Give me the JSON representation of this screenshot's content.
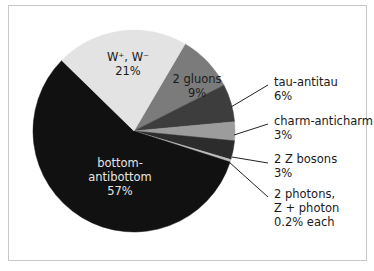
{
  "chart_data": {
    "type": "pie",
    "title": "",
    "center": [
      134,
      131
    ],
    "radius": 101,
    "start_angle_deg": -59.6,
    "slices": [
      {
        "name": "gluons",
        "label": "2 gluons",
        "value": 9,
        "value_label": "9%",
        "color": "#7b7b7b"
      },
      {
        "name": "tau",
        "label": "tau-antitau",
        "value": 6,
        "value_label": "6%",
        "color": "#3d3d3d"
      },
      {
        "name": "charm",
        "label": "charm-anticharm",
        "value": 3,
        "value_label": "3%",
        "color": "#9c9c9c"
      },
      {
        "name": "zz",
        "label": "2 Z bosons",
        "value": 3,
        "value_label": "3%",
        "color": "#2c2c2c"
      },
      {
        "name": "photons",
        "label": "2 photons, Z + photon",
        "value": 0.4,
        "value_label": "0.2% each",
        "color": "#bdbdbd"
      },
      {
        "name": "bottom",
        "label": "bottom-antibottom",
        "value": 57,
        "value_label": "57%",
        "color": "#111111"
      },
      {
        "name": "ww",
        "label": "W+, W-",
        "value": 21,
        "value_label": "21%",
        "color": "#e3e3e3"
      }
    ]
  },
  "labels": {
    "ww": {
      "line1": "W⁺, W⁻",
      "line2": "21%"
    },
    "gluons": {
      "line1": "2 gluons",
      "line2": "9%"
    },
    "bottom": {
      "line1": "bottom-",
      "line2": "antibottom",
      "line3": "57%"
    },
    "tau": {
      "line1": "tau-antitau",
      "line2": "6%"
    },
    "charm": {
      "line1": "charm-anticharm",
      "line2": "3%"
    },
    "zz": {
      "line1": "2 Z bosons",
      "line2": "3%"
    },
    "photons": {
      "line1": "2 photons,",
      "line2": "Z + photon",
      "line3": "0.2% each"
    }
  }
}
